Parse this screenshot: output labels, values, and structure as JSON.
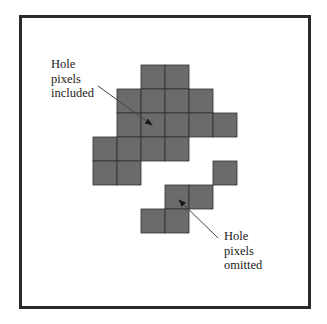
{
  "diagram": {
    "type": "pixel-region-illustration",
    "colors": {
      "cell_fill": "#6b6b6b",
      "cell_line": "#2f2f2f",
      "frame": "#2a2a2a",
      "arrow": "#444444",
      "background": "#ffffff"
    },
    "grid": {
      "origin_x": 93,
      "origin_y": 65,
      "cell_size": 24,
      "cells": [
        {
          "row": 0,
          "col": 2
        },
        {
          "row": 0,
          "col": 3
        },
        {
          "row": 1,
          "col": 1
        },
        {
          "row": 1,
          "col": 2
        },
        {
          "row": 1,
          "col": 3
        },
        {
          "row": 1,
          "col": 4
        },
        {
          "row": 2,
          "col": 1
        },
        {
          "row": 2,
          "col": 2
        },
        {
          "row": 2,
          "col": 3
        },
        {
          "row": 2,
          "col": 4
        },
        {
          "row": 2,
          "col": 5
        },
        {
          "row": 3,
          "col": 0
        },
        {
          "row": 3,
          "col": 1
        },
        {
          "row": 3,
          "col": 2
        },
        {
          "row": 3,
          "col": 3
        },
        {
          "row": 4,
          "col": 0
        },
        {
          "row": 4,
          "col": 1
        },
        {
          "row": 4,
          "col": 5
        },
        {
          "row": 5,
          "col": 3
        },
        {
          "row": 5,
          "col": 4
        },
        {
          "row": 6,
          "col": 2
        },
        {
          "row": 6,
          "col": 3
        }
      ]
    },
    "annotations": [
      {
        "id": "included",
        "lines": [
          "Hole",
          "pixels",
          "included"
        ],
        "arrow": {
          "x1": 98,
          "y1": 86,
          "x2": 152,
          "y2": 125
        }
      },
      {
        "id": "omitted",
        "lines": [
          "Hole",
          "pixels",
          "omitted"
        ],
        "arrow": {
          "x1": 218,
          "y1": 238,
          "x2": 179,
          "y2": 200
        }
      }
    ]
  }
}
